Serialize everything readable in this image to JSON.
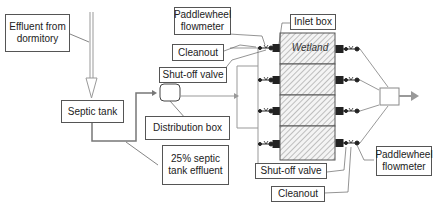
{
  "labels": {
    "effluent_from_dormitory": "Effluent from dormitory",
    "septic_tank": "Septic tank",
    "distribution_box": "Distribution box",
    "septic_effluent_25": "25% septic tank effluent",
    "paddlewheel_flowmeter_top": "Paddlewheel flowmeter",
    "cleanout_top": "Cleanout",
    "shutoff_valve_top": "Shut-off valve",
    "inlet_box": "Inlet box",
    "wetland": "Wetland",
    "shutoff_valve_bottom": "Shut-off valve",
    "cleanout_bottom": "Cleanout",
    "paddlewheel_flowmeter_bottom": "Paddlewheel flowmeter"
  },
  "wetland_cells": 4,
  "colors": {
    "pipe": "#9a9a9a",
    "outline": "#555555",
    "hatch": "#888888",
    "fitting": "#222222"
  }
}
